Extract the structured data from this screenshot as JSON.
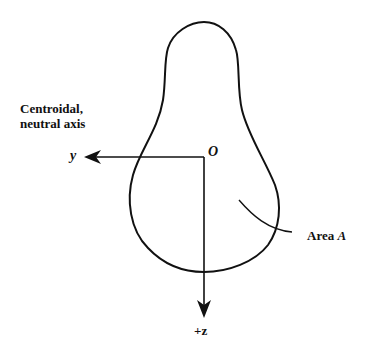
{
  "diagram": {
    "labels": {
      "axis_title_line1": "Centroidal,",
      "axis_title_line2": "neutral axis",
      "y_axis": "y",
      "origin": "O",
      "z_axis": "+z",
      "area_label": "Area",
      "area_symbol": "A"
    },
    "colors": {
      "stroke": "#111111",
      "background": "#ffffff"
    }
  }
}
